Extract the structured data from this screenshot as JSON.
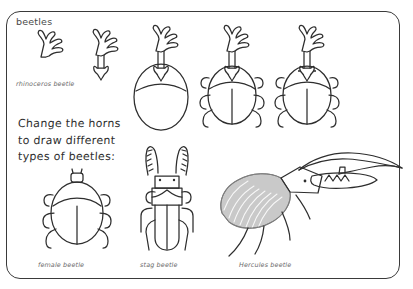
{
  "page": {
    "title": "beetles",
    "border_color": "#3a3a3a",
    "background": "#ffffff",
    "ink_color": "#2e2e2e",
    "shading_color": "#9a9a9a"
  },
  "instruction": {
    "line1": "Change the horns",
    "line2": "to draw different",
    "line3": "types of beetles:"
  },
  "captions": {
    "rhinoceros": "rhinoceros beetle",
    "female": "female beetle",
    "stag": "stag beetle",
    "hercules": "Hercules beetle"
  },
  "tutorial_steps": [
    {
      "name": "horn-only",
      "label": "horn fork"
    },
    {
      "name": "horn-with-stem",
      "label": "horn with stem"
    },
    {
      "name": "horn-body",
      "label": "horn and body"
    },
    {
      "name": "horn-body-legs",
      "label": "horn, body and legs"
    },
    {
      "name": "complete-beetle",
      "label": "complete rhinoceros beetle"
    }
  ],
  "drawings": [
    {
      "name": "female-beetle",
      "caption": "female beetle"
    },
    {
      "name": "stag-beetle",
      "caption": "stag beetle"
    },
    {
      "name": "hercules-beetle",
      "caption": "Hercules beetle"
    }
  ]
}
